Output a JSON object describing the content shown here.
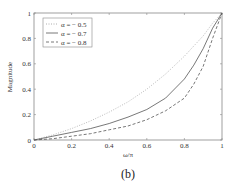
{
  "caption": "(b)",
  "chart_data": {
    "type": "line",
    "title": "",
    "xlabel": "ω/π",
    "ylabel": "Magnitude",
    "xlim": [
      0,
      1
    ],
    "ylim": [
      0,
      1.05
    ],
    "xticks": [
      "0",
      "0.2",
      "0.4",
      "0.6",
      "0.8",
      "1"
    ],
    "yticks": [
      "0",
      "0.2",
      "0.4",
      "0.6",
      "0.8",
      "1"
    ],
    "grid": false,
    "legend_position": "upper left",
    "x": [
      0,
      0.1,
      0.2,
      0.3,
      0.4,
      0.5,
      0.6,
      0.7,
      0.8,
      0.85,
      0.9,
      0.95,
      1.0
    ],
    "series": [
      {
        "name": "α = − 0.5",
        "style": "dotted",
        "values": [
          0,
          0.04,
          0.09,
          0.15,
          0.22,
          0.3,
          0.4,
          0.52,
          0.66,
          0.74,
          0.82,
          0.92,
          1.0
        ]
      },
      {
        "name": "α = − 0.7",
        "style": "solid",
        "values": [
          0,
          0.03,
          0.06,
          0.09,
          0.13,
          0.18,
          0.24,
          0.33,
          0.48,
          0.59,
          0.72,
          0.88,
          1.0
        ]
      },
      {
        "name": "α = − 0.8",
        "style": "dashed",
        "values": [
          0,
          0.01,
          0.03,
          0.05,
          0.08,
          0.11,
          0.16,
          0.23,
          0.33,
          0.44,
          0.58,
          0.8,
          1.0
        ]
      }
    ]
  }
}
